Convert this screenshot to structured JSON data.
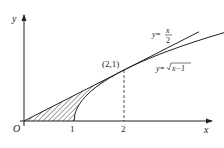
{
  "diagram": {
    "type": "function-graph",
    "axes": {
      "x_label": "x",
      "y_label": "y",
      "origin_label": "O",
      "x_ticks": [
        "1",
        "2"
      ]
    },
    "curves": [
      {
        "name": "line",
        "label_prefix": "y=",
        "label_num": "x",
        "label_den": "2",
        "expr": "x/2"
      },
      {
        "name": "sqrt",
        "label_prefix": "y=",
        "label_rad": "x−1",
        "expr": "sqrt(x-1)"
      }
    ],
    "point": {
      "label": "(2,1)",
      "x": 2,
      "y": 1
    },
    "shaded_region": "between y=x/2 and y=sqrt(x-1) from x=0 to x=2, above x-axis",
    "colors": {
      "ink": "#222222",
      "background": "#ffffff"
    }
  }
}
